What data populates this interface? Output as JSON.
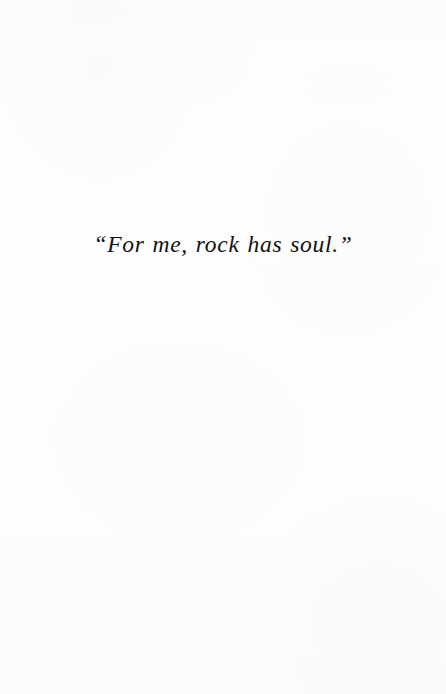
{
  "page": {
    "kind": "book-epigraph-page",
    "background_color": "#fdfdfd",
    "ink_color": "#121212"
  },
  "epigraph": {
    "quote_text": "“For me, rock has soul.”"
  }
}
